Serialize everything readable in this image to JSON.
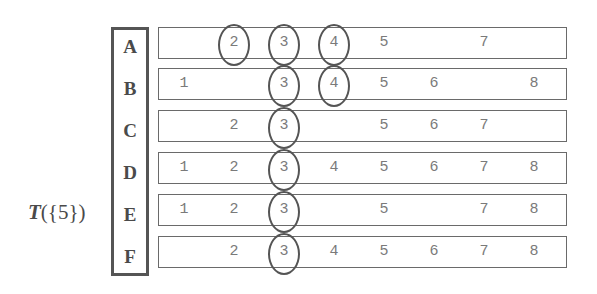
{
  "diagram": {
    "label": {
      "function": "T",
      "argument": "({5})"
    },
    "columns": [
      1,
      2,
      3,
      4,
      5,
      6,
      7,
      8
    ],
    "rows": [
      {
        "letter": "A",
        "values": [
          "",
          "2",
          "3",
          "4",
          "5",
          "",
          "7",
          ""
        ],
        "circled": [
          2,
          3,
          4
        ]
      },
      {
        "letter": "B",
        "values": [
          "1",
          "",
          "3",
          "4",
          "5",
          "6",
          "",
          "8"
        ],
        "circled": [
          3,
          4
        ]
      },
      {
        "letter": "C",
        "values": [
          "",
          "2",
          "3",
          "",
          "5",
          "6",
          "7",
          ""
        ],
        "circled": [
          3
        ]
      },
      {
        "letter": "D",
        "values": [
          "1",
          "2",
          "3",
          "4",
          "5",
          "6",
          "7",
          "8"
        ],
        "circled": [
          3
        ]
      },
      {
        "letter": "E",
        "values": [
          "1",
          "2",
          "3",
          "",
          "5",
          "",
          "7",
          "8"
        ],
        "circled": [
          3
        ]
      },
      {
        "letter": "F",
        "values": [
          "",
          "2",
          "3",
          "4",
          "5",
          "6",
          "7",
          "8"
        ],
        "circled": [
          3
        ]
      }
    ],
    "colors": {
      "text": "#4a4a4a",
      "cell_text": "#7a7a7a",
      "border": "#555555",
      "row_border": "#6a6a6a",
      "background": "#ffffff"
    }
  }
}
